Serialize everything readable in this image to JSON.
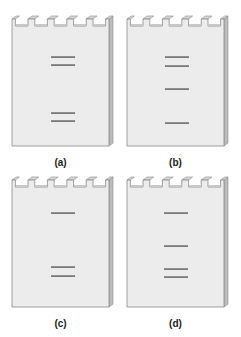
{
  "figure": {
    "gel_fill": "#ececec",
    "gel_side": "#bdbdbd",
    "gel_edge": "#8a8a8a",
    "band_color": "#7a7a7a",
    "wells_per_gel": 5,
    "panels": [
      {
        "label": "(a)",
        "x": 12,
        "y": 15,
        "bands_y": [
          53,
          61,
          109,
          117
        ],
        "band_x": 51
      },
      {
        "label": "(b)",
        "x": 127,
        "y": 15,
        "bands_y": [
          53,
          62,
          85,
          119
        ],
        "band_x": 165
      },
      {
        "label": "(c)",
        "x": 12,
        "y": 176,
        "bands_y": [
          209,
          263,
          272
        ],
        "band_x": 51
      },
      {
        "label": "(d)",
        "x": 127,
        "y": 176,
        "bands_y": [
          209,
          242,
          265,
          273
        ],
        "band_x": 164
      }
    ]
  }
}
